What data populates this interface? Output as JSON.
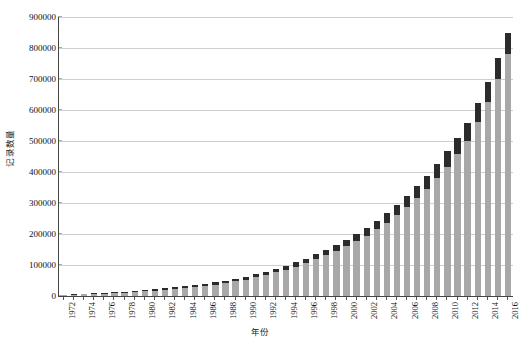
{
  "chart_data": {
    "type": "bar",
    "title": "",
    "subtitle": "",
    "xlabel": "年份",
    "ylabel": "记录数量",
    "ylim": [
      0,
      900000
    ],
    "ytick_step": 100000,
    "yticks": [
      "0",
      "100000",
      "200000",
      "300000",
      "400000",
      "500000",
      "600000",
      "700000",
      "800000",
      "900000"
    ],
    "grid": true,
    "legend": "none",
    "stacked": true,
    "xtick_interval_years": 2,
    "colors": {
      "segment_base": "#a8a8a8",
      "segment_top": "#2b2b2b",
      "gridline": "#cfcfcf",
      "axis": "#444444",
      "text": "#111111",
      "background": "#ffffff"
    },
    "categories": [
      "1972",
      "1973",
      "1974",
      "1975",
      "1976",
      "1977",
      "1978",
      "1979",
      "1980",
      "1981",
      "1982",
      "1983",
      "1984",
      "1985",
      "1986",
      "1987",
      "1988",
      "1989",
      "1990",
      "1991",
      "1992",
      "1993",
      "1994",
      "1995",
      "1996",
      "1997",
      "1998",
      "1999",
      "2000",
      "2001",
      "2002",
      "2003",
      "2004",
      "2005",
      "2006",
      "2007",
      "2008",
      "2009",
      "2010",
      "2011",
      "2012",
      "2013",
      "2014",
      "2015",
      "2016"
    ],
    "xtick_labels": [
      "1972",
      "1974",
      "1976",
      "1978",
      "1980",
      "1982",
      "1984",
      "1986",
      "1988",
      "1990",
      "1992",
      "1994",
      "1996",
      "1998",
      "2000",
      "2002",
      "2004",
      "2006",
      "2008",
      "2010",
      "2012",
      "2014",
      "2016"
    ],
    "series": [
      {
        "name": "base",
        "values": [
          3000,
          4000,
          5000,
          6500,
          8000,
          9500,
          11000,
          13000,
          15000,
          17500,
          20000,
          23000,
          26000,
          29000,
          33000,
          37000,
          42000,
          47000,
          53000,
          60000,
          68000,
          76000,
          85000,
          95000,
          106000,
          118000,
          131000,
          145000,
          160000,
          177000,
          195000,
          215000,
          237000,
          261000,
          287000,
          315000,
          346000,
          380000,
          417000,
          457000,
          500000,
          560000,
          625000,
          700000,
          780000
        ]
      },
      {
        "name": "top",
        "values": [
          1500,
          1700,
          2000,
          2200,
          2500,
          2800,
          3000,
          3300,
          3600,
          4000,
          4400,
          4800,
          5200,
          5700,
          6200,
          6800,
          7400,
          8000,
          8800,
          9600,
          10500,
          11500,
          12500,
          13700,
          15000,
          16400,
          17900,
          19500,
          21300,
          23300,
          25400,
          27700,
          30200,
          32900,
          35800,
          39000,
          42400,
          46000,
          50000,
          54000,
          58000,
          62000,
          66000,
          68000,
          70000
        ]
      }
    ],
    "totals": [
      4500,
      5700,
      7000,
      8700,
      10500,
      12300,
      14000,
      16300,
      18600,
      21500,
      24400,
      27800,
      31200,
      34700,
      39200,
      43800,
      49400,
      55000,
      61800,
      69600,
      78500,
      87500,
      97500,
      108700,
      121000,
      134400,
      148900,
      164500,
      181300,
      200300,
      220400,
      242700,
      267200,
      293900,
      322800,
      354000,
      388400,
      426000,
      467000,
      511000,
      558000,
      622000,
      691000,
      768000,
      850000
    ]
  }
}
